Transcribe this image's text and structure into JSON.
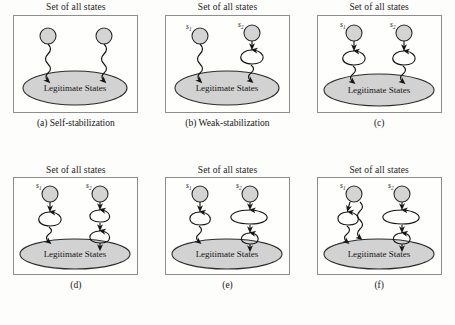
{
  "figure": {
    "panel_title": "Set of all states",
    "legitimate_label": "Legitimate States",
    "state_labels": {
      "s1": "s",
      "s1_sub": "1",
      "s2": "s",
      "s2_sub": "2"
    },
    "colors": {
      "background": "#fdfdfb",
      "box_border": "#8d8d8d",
      "node_fill": "#d4d4d4",
      "node_stroke": "#2b2b2b",
      "ellipse_fill": "#d2d2d2",
      "ellipse_stroke": "#2b2b2b",
      "edge_stroke": "#161616",
      "text": "#161616"
    },
    "panels": [
      {
        "id": "a",
        "caption": "(a) Self-stabilization",
        "title": "Set of all states",
        "legitimate": "Legitimate States",
        "show_state_labels": false,
        "nodes": [
          {
            "name": "left-node",
            "label": "",
            "edge": "wavy",
            "loops": 0
          },
          {
            "name": "right-node",
            "label": "",
            "edge": "wavy",
            "loops": 0
          }
        ]
      },
      {
        "id": "b",
        "caption": "(b) Weak-stabilization",
        "title": "Set of all states",
        "legitimate": "Legitimate States",
        "show_state_labels": true,
        "nodes": [
          {
            "name": "s1-node",
            "label": "s1",
            "edge": "wavy",
            "loops": 0
          },
          {
            "name": "s2-node",
            "label": "s2",
            "edge": "wavy",
            "loops": 1
          }
        ]
      },
      {
        "id": "c",
        "caption": "(c)",
        "title": "Set of all states",
        "legitimate": "Legitimate States",
        "show_state_labels": true,
        "nodes": [
          {
            "name": "s1-node",
            "label": "s1",
            "edge": "wavy",
            "loops": 1
          },
          {
            "name": "s2-node",
            "label": "s2",
            "edge": "wavy",
            "loops": 1
          }
        ]
      },
      {
        "id": "d",
        "caption": "(d)",
        "title": "Set of all states",
        "legitimate": "Legitimate States",
        "show_state_labels": true,
        "nodes": [
          {
            "name": "s1-node",
            "label": "s1",
            "edge": "wavy",
            "loops": 1
          },
          {
            "name": "s2-node",
            "label": "s2",
            "edge": "straight",
            "loops": 2
          }
        ]
      },
      {
        "id": "e",
        "caption": "(e)",
        "title": "Set of all states",
        "legitimate": "Legitimate States",
        "show_state_labels": true,
        "nodes": [
          {
            "name": "s1-node",
            "label": "s1",
            "edge": "wavy",
            "loops": 1
          },
          {
            "name": "s2-node",
            "label": "s2",
            "edge": "straight",
            "loops": 2,
            "wide_first_loop": true
          }
        ]
      },
      {
        "id": "f",
        "caption": "(f)",
        "title": "Set of all states",
        "legitimate": "Legitimate States",
        "show_state_labels": true,
        "nodes": [
          {
            "name": "s1-node",
            "label": "s1",
            "edge": "wavy",
            "loops": 1,
            "extra_wavy_branch": true
          },
          {
            "name": "s2-node",
            "label": "s2",
            "edge": "straight",
            "loops": 2,
            "wide_first_loop": true
          }
        ]
      }
    ]
  }
}
